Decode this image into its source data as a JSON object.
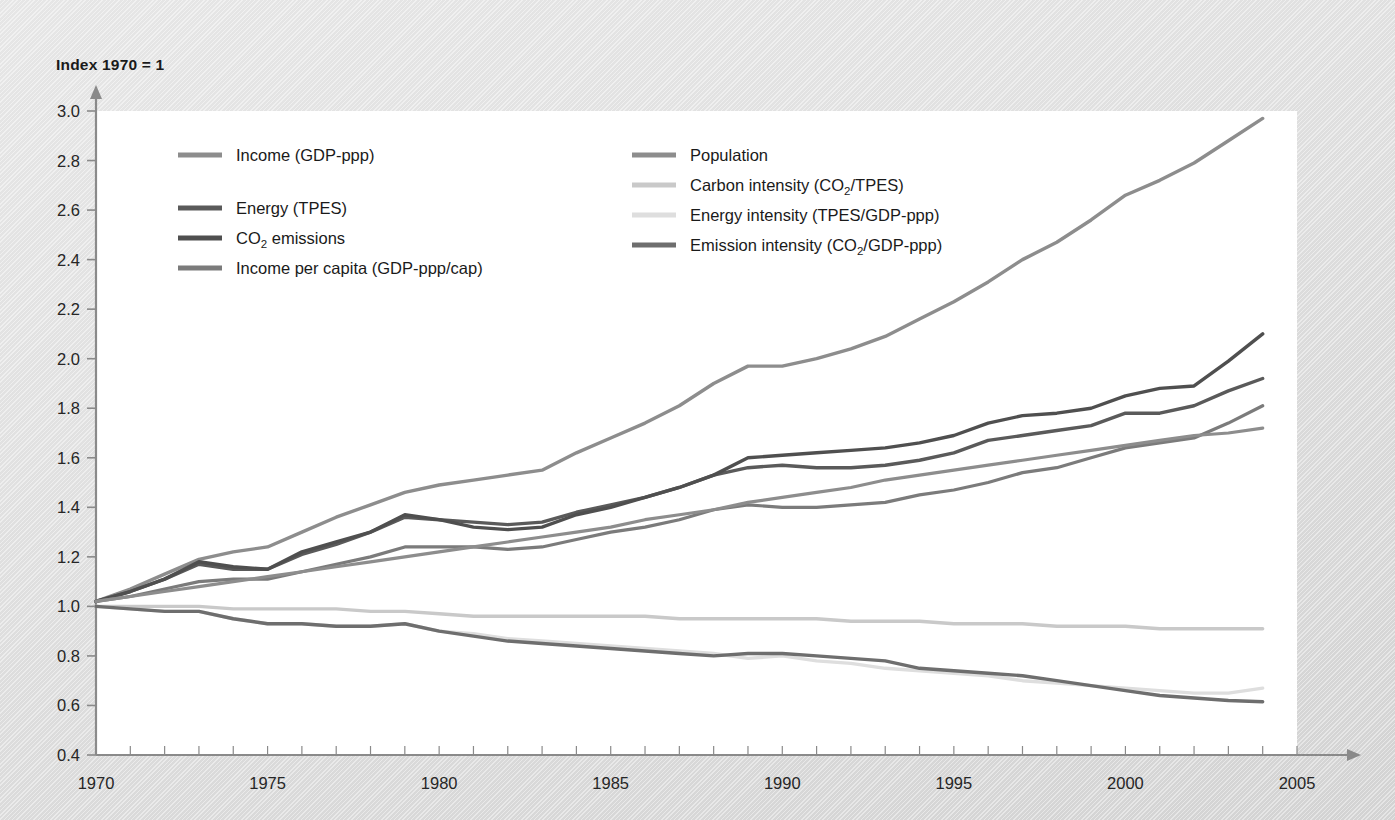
{
  "axis_title": "Index 1970 = 1",
  "colors": {
    "income": "#8d8d8d",
    "energy": "#5a5a5a",
    "co2": "#4f4f4f",
    "income_per_capita": "#7b7b7b",
    "population": "#8d8d8d",
    "carbon_intensity": "#c9c9c9",
    "energy_intensity": "#dedede",
    "emission_intensity": "#6e6e6e",
    "axis": "#8a8a8a",
    "text": "#1a1a1a",
    "plot_background": "#ffffff"
  },
  "legend": {
    "columns": [
      {
        "entries": [
          {
            "label": "Income (GDP-ppp)",
            "series": "income",
            "color": "#8d8d8d"
          },
          {
            "label": "Energy (TPES)",
            "series": "energy",
            "color": "#5a5a5a"
          },
          {
            "label": "CO2 emissions",
            "label_rich": [
              "CO",
              "2",
              " emissions"
            ],
            "series": "co2",
            "color": "#4f4f4f"
          },
          {
            "label": "Income per capita (GDP-ppp/cap)",
            "series": "income_per_capita",
            "color": "#7b7b7b"
          }
        ]
      },
      {
        "entries": [
          {
            "label": "Population",
            "series": "population",
            "color": "#8d8d8d"
          },
          {
            "label": "Carbon intensity (CO2/TPES)",
            "label_rich": [
              "Carbon intensity (CO",
              "2",
              "/TPES)"
            ],
            "series": "carbon_intensity",
            "color": "#c9c9c9"
          },
          {
            "label": "Energy intensity (TPES/GDP-ppp)",
            "series": "energy_intensity",
            "color": "#dedede"
          },
          {
            "label": "Emission intensity (CO2/GDP-ppp)",
            "label_rich": [
              "Emission intensity (CO",
              "2",
              "/GDP-ppp)"
            ],
            "series": "emission_intensity",
            "color": "#6e6e6e"
          }
        ]
      }
    ]
  },
  "chart_data": {
    "type": "line",
    "title": "",
    "xlabel": "",
    "ylabel": "Index 1970 = 1",
    "xlim": [
      1970,
      2005
    ],
    "ylim": [
      0.4,
      3.0
    ],
    "ytick_step": 0.2,
    "yticks": [
      0.4,
      0.6,
      0.8,
      1.0,
      1.2,
      1.4,
      1.6,
      1.8,
      2.0,
      2.2,
      2.4,
      2.6,
      2.8,
      3.0
    ],
    "ytick_labels": [
      "0.4",
      "0.6",
      "0.8",
      "1.0",
      "1.2",
      "1.4",
      "1.6",
      "1.8",
      "2.0",
      "2.2",
      "2.4",
      "2.6",
      "2.8",
      "3.0"
    ],
    "xticks": [
      1970,
      1975,
      1980,
      1985,
      1990,
      1995,
      2000,
      2005
    ],
    "xtick_labels": [
      "1970",
      "1975",
      "1980",
      "1985",
      "1990",
      "1995",
      "2000",
      "2005"
    ],
    "x_minor_tick_step": 1,
    "grid": false,
    "legend_position": "inside-top-left",
    "x": [
      1970,
      1971,
      1972,
      1973,
      1974,
      1975,
      1976,
      1977,
      1978,
      1979,
      1980,
      1981,
      1982,
      1983,
      1984,
      1985,
      1986,
      1987,
      1988,
      1989,
      1990,
      1991,
      1992,
      1993,
      1994,
      1995,
      1996,
      1997,
      1998,
      1999,
      2000,
      2001,
      2002,
      2003,
      2004
    ],
    "series": [
      {
        "name": "Income (GDP-ppp)",
        "key": "income",
        "color": "#8d8d8d",
        "width": 3.4,
        "values": [
          1.02,
          1.07,
          1.13,
          1.19,
          1.22,
          1.24,
          1.3,
          1.36,
          1.41,
          1.46,
          1.49,
          1.51,
          1.53,
          1.55,
          1.62,
          1.68,
          1.74,
          1.81,
          1.9,
          1.97,
          1.97,
          2.0,
          2.04,
          2.09,
          2.16,
          2.23,
          2.31,
          2.4,
          2.47,
          2.56,
          2.66,
          2.72,
          2.79,
          2.88,
          2.97
        ]
      },
      {
        "name": "Energy (TPES)",
        "key": "energy",
        "color": "#5a5a5a",
        "width": 3.4,
        "values": [
          1.02,
          1.06,
          1.11,
          1.17,
          1.15,
          1.15,
          1.21,
          1.25,
          1.3,
          1.36,
          1.35,
          1.34,
          1.33,
          1.34,
          1.38,
          1.41,
          1.44,
          1.48,
          1.53,
          1.56,
          1.57,
          1.56,
          1.56,
          1.57,
          1.59,
          1.62,
          1.67,
          1.69,
          1.71,
          1.73,
          1.78,
          1.78,
          1.81,
          1.87,
          1.92
        ]
      },
      {
        "name": "CO2 emissions",
        "key": "co2",
        "color": "#4f4f4f",
        "width": 3.4,
        "values": [
          1.02,
          1.06,
          1.11,
          1.18,
          1.16,
          1.15,
          1.22,
          1.26,
          1.3,
          1.37,
          1.35,
          1.32,
          1.31,
          1.32,
          1.37,
          1.4,
          1.44,
          1.48,
          1.53,
          1.6,
          1.61,
          1.62,
          1.63,
          1.64,
          1.66,
          1.69,
          1.74,
          1.77,
          1.78,
          1.8,
          1.85,
          1.88,
          1.89,
          1.99,
          2.1
        ]
      },
      {
        "name": "Income per capita (GDP-ppp/cap)",
        "key": "income_per_capita",
        "color": "#7b7b7b",
        "width": 3.2,
        "values": [
          1.02,
          1.04,
          1.07,
          1.1,
          1.11,
          1.11,
          1.14,
          1.17,
          1.2,
          1.24,
          1.24,
          1.24,
          1.23,
          1.24,
          1.27,
          1.3,
          1.32,
          1.35,
          1.39,
          1.41,
          1.4,
          1.4,
          1.41,
          1.42,
          1.45,
          1.47,
          1.5,
          1.54,
          1.56,
          1.6,
          1.64,
          1.66,
          1.68,
          1.74,
          1.81
        ]
      },
      {
        "name": "Population",
        "key": "population",
        "color": "#8d8d8d",
        "width": 3.2,
        "values": [
          1.02,
          1.04,
          1.06,
          1.08,
          1.1,
          1.12,
          1.14,
          1.16,
          1.18,
          1.2,
          1.22,
          1.24,
          1.26,
          1.28,
          1.3,
          1.32,
          1.35,
          1.37,
          1.39,
          1.42,
          1.44,
          1.46,
          1.48,
          1.51,
          1.53,
          1.55,
          1.57,
          1.59,
          1.61,
          1.63,
          1.65,
          1.67,
          1.69,
          1.7,
          1.72
        ]
      },
      {
        "name": "Carbon intensity (CO2/TPES)",
        "key": "carbon_intensity",
        "color": "#c9c9c9",
        "width": 3.4,
        "values": [
          1.0,
          1.0,
          1.0,
          1.0,
          0.99,
          0.99,
          0.99,
          0.99,
          0.98,
          0.98,
          0.97,
          0.96,
          0.96,
          0.96,
          0.96,
          0.96,
          0.96,
          0.95,
          0.95,
          0.95,
          0.95,
          0.95,
          0.94,
          0.94,
          0.94,
          0.93,
          0.93,
          0.93,
          0.92,
          0.92,
          0.92,
          0.91,
          0.91,
          0.91,
          0.91
        ]
      },
      {
        "name": "Energy intensity (TPES/GDP-ppp)",
        "key": "energy_intensity",
        "color": "#dedede",
        "width": 3.4,
        "values": [
          1.0,
          0.99,
          0.98,
          0.98,
          0.95,
          0.93,
          0.93,
          0.92,
          0.92,
          0.93,
          0.9,
          0.89,
          0.87,
          0.86,
          0.85,
          0.84,
          0.83,
          0.82,
          0.81,
          0.79,
          0.8,
          0.78,
          0.77,
          0.75,
          0.74,
          0.73,
          0.72,
          0.7,
          0.69,
          0.68,
          0.67,
          0.66,
          0.65,
          0.65,
          0.67
        ]
      },
      {
        "name": "Emission intensity (CO2/GDP-ppp)",
        "key": "emission_intensity",
        "color": "#6e6e6e",
        "width": 3.4,
        "values": [
          1.0,
          0.99,
          0.98,
          0.98,
          0.95,
          0.93,
          0.93,
          0.92,
          0.92,
          0.93,
          0.9,
          0.88,
          0.86,
          0.85,
          0.84,
          0.83,
          0.82,
          0.81,
          0.8,
          0.81,
          0.81,
          0.8,
          0.79,
          0.78,
          0.75,
          0.74,
          0.73,
          0.72,
          0.7,
          0.68,
          0.66,
          0.64,
          0.63,
          0.62,
          0.615
        ]
      }
    ]
  },
  "geometry": {
    "plot_left": 96,
    "plot_right": 1297,
    "plot_top": 111,
    "plot_bottom": 755
  }
}
